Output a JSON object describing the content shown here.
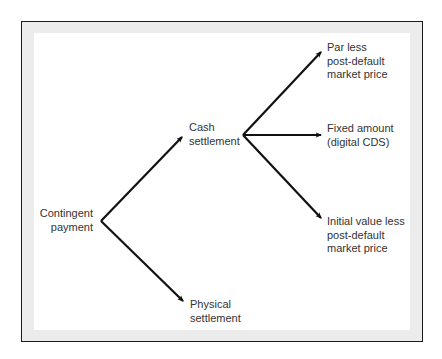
{
  "diagram": {
    "type": "tree",
    "root": {
      "lines": [
        "Contingent",
        "payment"
      ]
    },
    "branches": [
      {
        "lines": [
          "Cash",
          "settlement"
        ],
        "children": [
          {
            "lines": [
              "Par less",
              "post-default",
              "market price"
            ]
          },
          {
            "lines": [
              "Fixed amount",
              "(digital CDS)"
            ]
          },
          {
            "lines": [
              "Initial value less",
              "post-default",
              "market price"
            ]
          }
        ]
      },
      {
        "lines": [
          "Physical",
          "settlement"
        ]
      }
    ],
    "colors": {
      "border": "#1a1a1a",
      "frame_band": "#ececec",
      "background": "#ffffff",
      "arrow": "#111111",
      "text": "#333333"
    }
  }
}
